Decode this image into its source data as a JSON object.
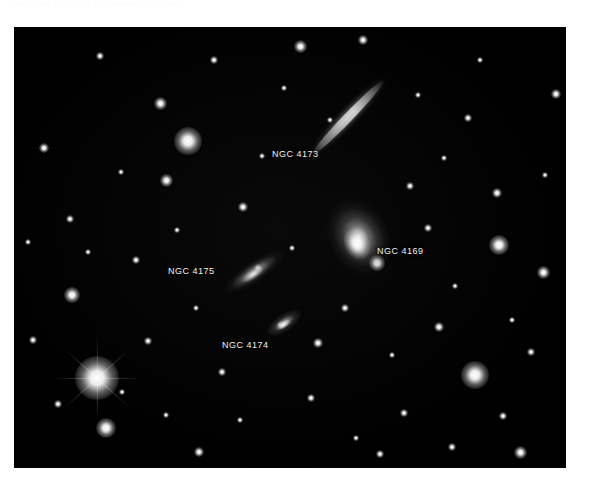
{
  "caption": {
    "text": "NGC 4169  4173  4174  4175  Hickson 61  The Box"
  },
  "image": {
    "title": "NGC 4169 Group",
    "frame_color": "#000000",
    "background_color": "#ffffff",
    "label_color": "#f2f2f2"
  },
  "labels": [
    {
      "name": "NGC 4173"
    },
    {
      "name": "NGC 4169"
    },
    {
      "name": "NGC 4175"
    },
    {
      "name": "NGC 4174"
    }
  ],
  "chart_data": {
    "type": "scatter",
    "xlabel": "",
    "ylabel": "",
    "grid": false,
    "legend": "none",
    "plot_box_px": {
      "x": 14,
      "y": 27,
      "width": 552,
      "height": 441
    },
    "galaxies": [
      {
        "name": "NGC 4173",
        "x_px": 334,
        "y_px": 137,
        "length_px": 128,
        "width_px": 24,
        "position_angle_deg": -46,
        "morphology": "edge-on spiral",
        "brightness": "faint-diffuse",
        "label_x_px": 258,
        "label_y_px": 122
      },
      {
        "name": "NGC 4169",
        "x_px": 345,
        "y_px": 210,
        "length_px": 100,
        "width_px": 76,
        "position_angle_deg": -28,
        "morphology": "lenticular S0",
        "brightness": "bright",
        "label_x_px": 363,
        "label_y_px": 219
      },
      {
        "name": "NGC 4175",
        "x_px": 240,
        "y_px": 245,
        "length_px": 74,
        "width_px": 22,
        "position_angle_deg": -34,
        "morphology": "edge-on spiral",
        "brightness": "moderate",
        "label_x_px": 154,
        "label_y_px": 239
      },
      {
        "name": "NGC 4174",
        "x_px": 270,
        "y_px": 296,
        "length_px": 42,
        "width_px": 18,
        "position_angle_deg": -34,
        "morphology": "edge-on lenticular",
        "brightness": "moderate",
        "label_x_px": 208,
        "label_y_px": 313
      }
    ],
    "stars": [
      {
        "x_px": 97,
        "y_px": 378,
        "size_px": 17,
        "spikes": true
      },
      {
        "x_px": 188,
        "y_px": 141,
        "size_px": 11,
        "spikes": false
      },
      {
        "x_px": 475,
        "y_px": 375,
        "size_px": 11,
        "spikes": false
      },
      {
        "x_px": 106,
        "y_px": 428,
        "size_px": 8,
        "spikes": false
      },
      {
        "x_px": 499,
        "y_px": 245,
        "size_px": 8,
        "spikes": false
      },
      {
        "x_px": 72,
        "y_px": 295,
        "size_px": 6,
        "spikes": false
      },
      {
        "x_px": 377,
        "y_px": 263,
        "size_px": 6,
        "spikes": false
      },
      {
        "x_px": 300,
        "y_px": 46,
        "size_px": 5,
        "spikes": false
      },
      {
        "x_px": 160,
        "y_px": 103,
        "size_px": 5,
        "spikes": false
      },
      {
        "x_px": 166,
        "y_px": 180,
        "size_px": 5,
        "spikes": false
      },
      {
        "x_px": 243,
        "y_px": 207,
        "size_px": 4,
        "spikes": false
      },
      {
        "x_px": 439,
        "y_px": 327,
        "size_px": 4,
        "spikes": false
      },
      {
        "x_px": 543,
        "y_px": 272,
        "size_px": 5,
        "spikes": false
      },
      {
        "x_px": 520,
        "y_px": 452,
        "size_px": 5,
        "spikes": false
      },
      {
        "x_px": 199,
        "y_px": 452,
        "size_px": 4,
        "spikes": false
      },
      {
        "x_px": 318,
        "y_px": 343,
        "size_px": 4,
        "spikes": false
      },
      {
        "x_px": 44,
        "y_px": 148,
        "size_px": 4,
        "spikes": false
      },
      {
        "x_px": 363,
        "y_px": 40,
        "size_px": 4,
        "spikes": false
      },
      {
        "x_px": 497,
        "y_px": 193,
        "size_px": 4,
        "spikes": false
      },
      {
        "x_px": 556,
        "y_px": 94,
        "size_px": 4,
        "spikes": false
      },
      {
        "x_px": 70,
        "y_px": 219,
        "size_px": 3,
        "spikes": false
      },
      {
        "x_px": 136,
        "y_px": 260,
        "size_px": 3,
        "spikes": false
      },
      {
        "x_px": 222,
        "y_px": 372,
        "size_px": 3,
        "spikes": false
      },
      {
        "x_px": 404,
        "y_px": 413,
        "size_px": 3,
        "spikes": false
      },
      {
        "x_px": 468,
        "y_px": 118,
        "size_px": 3,
        "spikes": false
      },
      {
        "x_px": 258,
        "y_px": 268,
        "size_px": 3,
        "spikes": false
      },
      {
        "x_px": 345,
        "y_px": 308,
        "size_px": 3,
        "spikes": false
      },
      {
        "x_px": 410,
        "y_px": 186,
        "size_px": 3,
        "spikes": false
      },
      {
        "x_px": 148,
        "y_px": 341,
        "size_px": 3,
        "spikes": false
      },
      {
        "x_px": 281,
        "y_px": 325,
        "size_px": 3,
        "spikes": false
      },
      {
        "x_px": 58,
        "y_px": 404,
        "size_px": 3,
        "spikes": false
      },
      {
        "x_px": 531,
        "y_px": 352,
        "size_px": 3,
        "spikes": false
      },
      {
        "x_px": 214,
        "y_px": 60,
        "size_px": 3,
        "spikes": false
      },
      {
        "x_px": 428,
        "y_px": 228,
        "size_px": 3,
        "spikes": false
      },
      {
        "x_px": 100,
        "y_px": 56,
        "size_px": 3,
        "spikes": false
      },
      {
        "x_px": 380,
        "y_px": 454,
        "size_px": 3,
        "spikes": false
      },
      {
        "x_px": 452,
        "y_px": 447,
        "size_px": 3,
        "spikes": false
      },
      {
        "x_px": 33,
        "y_px": 340,
        "size_px": 3,
        "spikes": false
      },
      {
        "x_px": 311,
        "y_px": 398,
        "size_px": 3,
        "spikes": false
      },
      {
        "x_px": 503,
        "y_px": 416,
        "size_px": 3,
        "spikes": false
      },
      {
        "x_px": 177,
        "y_px": 230,
        "size_px": 2,
        "spikes": false
      },
      {
        "x_px": 292,
        "y_px": 248,
        "size_px": 2,
        "spikes": false
      },
      {
        "x_px": 121,
        "y_px": 172,
        "size_px": 2,
        "spikes": false
      },
      {
        "x_px": 455,
        "y_px": 286,
        "size_px": 2,
        "spikes": false
      },
      {
        "x_px": 392,
        "y_px": 355,
        "size_px": 2,
        "spikes": false
      },
      {
        "x_px": 240,
        "y_px": 420,
        "size_px": 2,
        "spikes": false
      },
      {
        "x_px": 545,
        "y_px": 175,
        "size_px": 2,
        "spikes": false
      },
      {
        "x_px": 88,
        "y_px": 252,
        "size_px": 2,
        "spikes": false
      },
      {
        "x_px": 330,
        "y_px": 120,
        "size_px": 2,
        "spikes": false
      },
      {
        "x_px": 262,
        "y_px": 156,
        "size_px": 2,
        "spikes": false
      },
      {
        "x_px": 418,
        "y_px": 95,
        "size_px": 2,
        "spikes": false
      },
      {
        "x_px": 196,
        "y_px": 308,
        "size_px": 2,
        "spikes": false
      },
      {
        "x_px": 356,
        "y_px": 438,
        "size_px": 2,
        "spikes": false
      },
      {
        "x_px": 122,
        "y_px": 392,
        "size_px": 2,
        "spikes": false
      },
      {
        "x_px": 480,
        "y_px": 60,
        "size_px": 2,
        "spikes": false
      },
      {
        "x_px": 28,
        "y_px": 242,
        "size_px": 2,
        "spikes": false
      },
      {
        "x_px": 284,
        "y_px": 88,
        "size_px": 2,
        "spikes": false
      },
      {
        "x_px": 512,
        "y_px": 320,
        "size_px": 2,
        "spikes": false
      },
      {
        "x_px": 166,
        "y_px": 415,
        "size_px": 2,
        "spikes": false
      },
      {
        "x_px": 444,
        "y_px": 158,
        "size_px": 2,
        "spikes": false
      }
    ]
  }
}
